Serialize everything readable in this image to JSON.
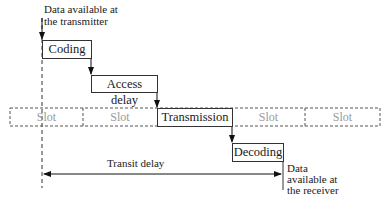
{
  "diagram": {
    "start_label": "Data available at the transmitter",
    "start_label_line1": "Data available at",
    "start_label_line2": "the transmitter",
    "end_label_line1": "Data",
    "end_label_line2": "available at",
    "end_label_line3": "the receiver",
    "stages": [
      {
        "label": "Coding"
      },
      {
        "label": "Access delay"
      },
      {
        "label": "Transmission"
      },
      {
        "label": "Decoding"
      }
    ],
    "slots": [
      {
        "label": "Slot"
      },
      {
        "label": "Slot"
      },
      {
        "label": "Transmission"
      },
      {
        "label": "Slot"
      },
      {
        "label": "Slot"
      }
    ],
    "transit_label": "Transit delay"
  }
}
